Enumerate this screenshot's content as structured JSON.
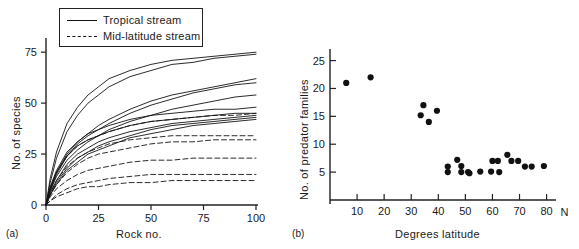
{
  "figure": {
    "panels": [
      {
        "key": "a",
        "label": "(a)"
      },
      {
        "key": "b",
        "label": "(b)"
      }
    ]
  },
  "panel_a": {
    "label": "(a)",
    "xlabel": "Rock no.",
    "ylabel": "No. of species",
    "xticks": [
      "0",
      "25",
      "50",
      "75",
      "100"
    ],
    "yticks": [
      "0",
      "25",
      "50",
      "75"
    ],
    "legend": [
      {
        "label": "Tropical stream",
        "style": "solid"
      },
      {
        "label": "Mid-latitude stream",
        "style": "dashed"
      }
    ]
  },
  "panel_b": {
    "label": "(b)",
    "xlabel": "Degrees latitude",
    "ylabel": "No. of predator families",
    "axis_suffix": "N",
    "xticks": [
      "10",
      "20",
      "30",
      "40",
      "50",
      "60",
      "70",
      "80"
    ],
    "yticks": [
      "5",
      "10",
      "15",
      "20",
      "25"
    ]
  },
  "chart_data": [
    {
      "type": "line",
      "title": "",
      "xlabel": "Rock no.",
      "ylabel": "No. of species",
      "xlim": [
        0,
        100
      ],
      "ylim": [
        0,
        80
      ],
      "grid": false,
      "legend_position": "top-left",
      "legend": [
        "Tropical stream",
        "Mid-latitude stream"
      ],
      "x": [
        0,
        2,
        5,
        10,
        15,
        20,
        25,
        30,
        40,
        50,
        60,
        70,
        80,
        90,
        100
      ],
      "series": [
        {
          "name": "Tropical stream 1",
          "style": "solid",
          "values": [
            0,
            13,
            26,
            40,
            48,
            54,
            58,
            62,
            66,
            69,
            71,
            72,
            73,
            74,
            75
          ]
        },
        {
          "name": "Tropical stream 2",
          "style": "solid",
          "values": [
            0,
            11,
            23,
            36,
            44,
            50,
            54,
            58,
            63,
            66,
            69,
            70,
            72,
            73,
            74
          ]
        },
        {
          "name": "Tropical stream 3",
          "style": "solid",
          "values": [
            0,
            8,
            16,
            25,
            31,
            35,
            39,
            42,
            47,
            51,
            54,
            56,
            58,
            60,
            62
          ]
        },
        {
          "name": "Tropical stream 4",
          "style": "solid",
          "values": [
            0,
            7,
            15,
            24,
            30,
            34,
            37,
            40,
            45,
            49,
            52,
            55,
            57,
            59,
            60
          ]
        },
        {
          "name": "Tropical stream 5",
          "style": "solid",
          "values": [
            0,
            7,
            14,
            22,
            27,
            31,
            34,
            37,
            41,
            44,
            47,
            49,
            51,
            53,
            54
          ]
        },
        {
          "name": "Tropical stream 6",
          "style": "solid",
          "values": [
            0,
            9,
            17,
            26,
            31,
            35,
            37,
            39,
            42,
            44,
            45,
            46,
            47,
            47,
            48
          ]
        },
        {
          "name": "Tropical stream 7",
          "style": "solid",
          "values": [
            0,
            8,
            16,
            24,
            29,
            32,
            34,
            36,
            39,
            41,
            42,
            43,
            44,
            45,
            45
          ]
        },
        {
          "name": "Tropical stream 8",
          "style": "solid",
          "values": [
            0,
            6,
            12,
            20,
            25,
            28,
            31,
            33,
            36,
            38,
            40,
            41,
            42,
            43,
            44
          ]
        },
        {
          "name": "Tropical stream 9",
          "style": "solid",
          "values": [
            0,
            5,
            11,
            18,
            23,
            26,
            29,
            31,
            34,
            37,
            39,
            40,
            41,
            42,
            43
          ]
        },
        {
          "name": "Tropical stream 10",
          "style": "solid",
          "values": [
            0,
            5,
            10,
            17,
            21,
            25,
            27,
            29,
            33,
            35,
            37,
            39,
            40,
            41,
            42
          ]
        },
        {
          "name": "Mid-latitude stream 1",
          "style": "dashed",
          "values": [
            0,
            8,
            16,
            24,
            29,
            32,
            34,
            36,
            39,
            41,
            42,
            43,
            44,
            44,
            45
          ]
        },
        {
          "name": "Mid-latitude stream 2",
          "style": "dashed",
          "values": [
            0,
            6,
            12,
            19,
            23,
            26,
            28,
            30,
            32,
            33,
            34,
            34,
            34,
            34,
            34
          ]
        },
        {
          "name": "Mid-latitude stream 3",
          "style": "dashed",
          "values": [
            0,
            5,
            10,
            16,
            20,
            23,
            25,
            26,
            28,
            30,
            31,
            31,
            32,
            32,
            32
          ]
        },
        {
          "name": "Mid-latitude stream 4",
          "style": "dashed",
          "values": [
            0,
            4,
            8,
            12,
            15,
            17,
            18,
            19,
            21,
            22,
            22,
            23,
            23,
            23,
            23
          ]
        },
        {
          "name": "Mid-latitude stream 5",
          "style": "dashed",
          "values": [
            0,
            2,
            5,
            8,
            10,
            11,
            12,
            13,
            14,
            15,
            15,
            15,
            15,
            15,
            15
          ]
        },
        {
          "name": "Mid-latitude stream 6",
          "style": "dashed",
          "values": [
            0,
            2,
            4,
            6,
            8,
            9,
            9,
            10,
            11,
            11,
            12,
            12,
            12,
            12,
            12
          ]
        }
      ]
    },
    {
      "type": "scatter",
      "title": "",
      "xlabel": "Degrees latitude",
      "ylabel": "No. of predator families",
      "xlim": [
        0,
        82
      ],
      "ylim": [
        0,
        26
      ],
      "grid": false,
      "marker": "filled-circle",
      "points": [
        {
          "x": 6,
          "y": 21
        },
        {
          "x": 15,
          "y": 22
        },
        {
          "x": 33.5,
          "y": 15.2
        },
        {
          "x": 34.5,
          "y": 17
        },
        {
          "x": 36.5,
          "y": 14
        },
        {
          "x": 39.5,
          "y": 16
        },
        {
          "x": 43.5,
          "y": 6
        },
        {
          "x": 43.5,
          "y": 5
        },
        {
          "x": 47,
          "y": 7.2
        },
        {
          "x": 48.5,
          "y": 6.1
        },
        {
          "x": 48.5,
          "y": 5
        },
        {
          "x": 51,
          "y": 5
        },
        {
          "x": 51.5,
          "y": 4.8
        },
        {
          "x": 55.5,
          "y": 5.1
        },
        {
          "x": 59.5,
          "y": 5.1
        },
        {
          "x": 60,
          "y": 7
        },
        {
          "x": 62,
          "y": 7
        },
        {
          "x": 62.5,
          "y": 5
        },
        {
          "x": 65.5,
          "y": 8.1
        },
        {
          "x": 67,
          "y": 7
        },
        {
          "x": 69.5,
          "y": 7
        },
        {
          "x": 72,
          "y": 6
        },
        {
          "x": 74.5,
          "y": 6
        },
        {
          "x": 79,
          "y": 6.1
        }
      ]
    }
  ]
}
